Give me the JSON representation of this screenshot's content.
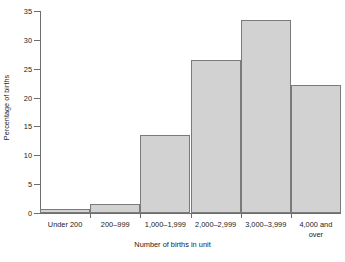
{
  "chart_data": {
    "type": "bar",
    "title": "",
    "subtitle": "",
    "xlabel": "Number of births in unit",
    "ylabel": "Percentage of births",
    "categories": [
      "Under 200",
      "200–999",
      "1,000–1,999",
      "2,000–2,999",
      "3,000–3,999",
      "4,000 and\nover"
    ],
    "values": [
      0.7,
      1.5,
      13.6,
      26.5,
      33.4,
      22.2
    ],
    "ylim": [
      0,
      35
    ],
    "xlim": [
      0,
      6
    ],
    "ytick_labels": [
      "0",
      "5",
      "10",
      "15",
      "20",
      "25",
      "30",
      "35"
    ],
    "ytick_values": [
      0,
      5,
      10,
      15,
      20,
      25,
      30,
      35
    ],
    "grid": false,
    "legend": null,
    "legend_position": "none",
    "bar_fill_color": "#d2d2d2",
    "bar_border_color": "#7a7a7a",
    "axis_color": "#6e6e6e",
    "text_color": "#222222",
    "background_color": "#ffffff"
  }
}
